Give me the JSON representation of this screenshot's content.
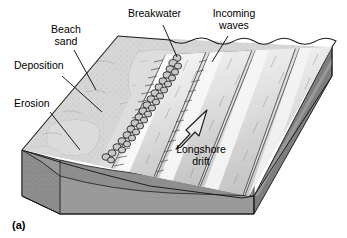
{
  "figure": {
    "panel_label": "(a)",
    "labels": [
      {
        "id": "beach-sand",
        "text": "Beach\nsand",
        "x": 62,
        "y": 28,
        "align": "center"
      },
      {
        "id": "breakwater",
        "text": "Breakwater",
        "x": 131,
        "y": 10,
        "align": "left"
      },
      {
        "id": "incoming-waves",
        "text": "Incoming\nwaves",
        "x": 232,
        "y": 10,
        "align": "center"
      },
      {
        "id": "deposition",
        "text": "Deposition",
        "x": 16,
        "y": 62,
        "align": "left"
      },
      {
        "id": "erosion",
        "text": "Erosion",
        "x": 16,
        "y": 100,
        "align": "left"
      },
      {
        "id": "longshore-drift",
        "text": "Longshore\ndrift",
        "x": 200,
        "y": 148,
        "align": "center"
      }
    ],
    "leader_lines": [
      {
        "id": "beach-sand-leader",
        "x1": 74,
        "y1": 50,
        "x2": 96,
        "y2": 90
      },
      {
        "id": "breakwater-leader",
        "x1": 163,
        "y1": 25,
        "x2": 177,
        "y2": 57
      },
      {
        "id": "incoming-waves-leader",
        "x1": 228,
        "y1": 36,
        "x2": 212,
        "y2": 62
      },
      {
        "id": "deposition-leader",
        "x1": 62,
        "y1": 76,
        "x2": 102,
        "y2": 112
      },
      {
        "id": "erosion-leader",
        "x1": 50,
        "y1": 112,
        "x2": 80,
        "y2": 150
      }
    ],
    "arrow": {
      "id": "longshore-drift-arrow",
      "direction": "up-right",
      "tail_x": 178,
      "tail_y": 146,
      "tip_x": 207,
      "tip_y": 110
    },
    "colors": {
      "beach_sand": "#d4d4d4",
      "beach_sand_light": "#dedede",
      "water_band_light": "#e9e9e9",
      "water_band_mid": "#c9c9c9",
      "wave_crest": "#f4f4f4",
      "block_front_water": "#8e8e8e",
      "block_front_sediment": "#9a9a9a",
      "block_side_dark": "#838383",
      "outline": "#1a1a1a",
      "label_text": "#000000",
      "background": "#ffffff"
    },
    "features": [
      {
        "id": "breakwater-boulders",
        "type": "boulder-chain",
        "count": 34
      },
      {
        "id": "wave-bands",
        "type": "diagonal-wave-crests",
        "count": 5
      }
    ]
  }
}
